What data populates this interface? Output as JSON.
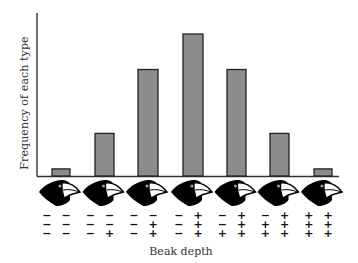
{
  "chart_data": {
    "type": "bar",
    "title": "",
    "xlabel": "Beak depth",
    "ylabel": "Frequency of each type",
    "categories": [
      "--/--/--",
      "--/--/-+",
      "--/-+/-+",
      "-+/-+/-+",
      "-+/-+/++",
      "-+/++/++",
      "++/++/++"
    ],
    "values": [
      1,
      6,
      15,
      20,
      15,
      6,
      1
    ],
    "ylim": [
      0,
      22
    ],
    "grid": false,
    "legend": "none",
    "bar_color": "#8c8c8c",
    "bar_edge_color": "#222222",
    "genotypes": [
      [
        "− −",
        "− −",
        "− −"
      ],
      [
        "− −",
        "− −",
        "− +"
      ],
      [
        "− −",
        "− +",
        "− +"
      ],
      [
        "− +",
        "− +",
        "− +"
      ],
      [
        "− +",
        "− +",
        "+ +"
      ],
      [
        "− +",
        "+ +",
        "+ +"
      ],
      [
        "+ +",
        "+ +",
        "+ +"
      ]
    ],
    "x_icons": [
      "finch-head-icon",
      "finch-head-icon",
      "finch-head-icon",
      "finch-head-icon",
      "finch-head-icon",
      "finch-head-icon",
      "finch-head-icon"
    ]
  },
  "labels": {
    "ylabel": "Frequency of each type",
    "xlabel": "Beak depth"
  }
}
